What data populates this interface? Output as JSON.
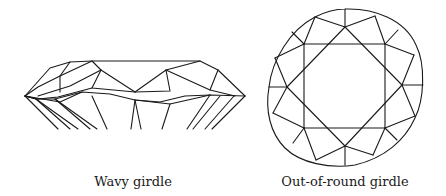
{
  "figures": [
    {
      "id": "wavy",
      "label": "Wavy girdle",
      "label_pos": [
        133,
        174
      ],
      "paths": [
        "M 25 96 L 50 68 L 70 62 L 92 61 L 155 61 L 200 61 L 218 70 L 245 96",
        "M 25 96 L 38 87 L 60 76 L 70 62",
        "M 60 76 L 60 92",
        "M 60 76 L 92 61 L 101 70 L 135 92 L 166 70 L 200 61",
        "M 101 70 L 70 86 L 38 96",
        "M 101 70 L 92 88 L 135 92",
        "M 166 70 L 170 91 L 135 92",
        "M 166 70 L 210 90 L 235 96",
        "M 210 90 L 218 70",
        "M 25 96 L 38 99 L 58 97 L 92 88",
        "M 25 96 L 36 99 L 55 99 L 82 92 L 110 94 L 135 100 L 160 102 L 185 96 L 210 95 L 245 96",
        "M 25 96 L 60 102 L 82 92",
        "M 135 100 L 170 104 L 210 95",
        "M 25 96 L 58 129",
        "M 25 96 L 36 99 L 70 129",
        "M 36 99 L 78 129",
        "M 55 99 L 90 129",
        "M 55 99 L 97 129",
        "M 92 96 L 107 129",
        "M 135 100 L 131 129",
        "M 135 100 L 141 129",
        "M 170 104 L 162 129",
        "M 210 95 L 187 129",
        "M 220 96 L 193 129",
        "M 234 96 L 205 129",
        "M 245 96 L 212 129"
      ]
    },
    {
      "id": "round",
      "label": "Out-of-round girdle",
      "label_pos": [
        345,
        174
      ],
      "outline": "M 345 9 C 375 8, 405 20, 416 45 C 426 65, 424 100, 415 118 C 405 140, 385 158, 355 165 C 330 169, 300 163, 285 148 C 270 133, 265 110, 269 87 C 272 60, 290 30, 315 17 C 325 12, 335 9, 345 9 Z",
      "paths": [
        "M 304 44 L 385 44 L 385 128 L 304 128 Z",
        "M 345 27 L 402 85 L 345 146 L 287 87 Z",
        "M 345 9 L 345 27",
        "M 345 146 L 345 165",
        "M 269 87 L 287 87",
        "M 402 85 L 423 85",
        "M 315 17 L 345 27",
        "M 315 17 L 304 44",
        "M 292 32 L 304 44",
        "M 275 58 L 304 44",
        "M 275 58 L 287 87",
        "M 375 16 L 345 27",
        "M 375 16 L 385 44",
        "M 398 30 L 385 44",
        "M 414 55 L 385 44",
        "M 414 55 L 402 85",
        "M 415 116 L 385 128",
        "M 415 116 L 402 85",
        "M 397 140 L 385 128",
        "M 373 155 L 385 128",
        "M 373 155 L 345 146",
        "M 316 160 L 345 146",
        "M 316 160 L 304 128",
        "M 293 143 L 304 128",
        "M 273 113 L 304 128",
        "M 273 113 L 287 87"
      ]
    }
  ]
}
